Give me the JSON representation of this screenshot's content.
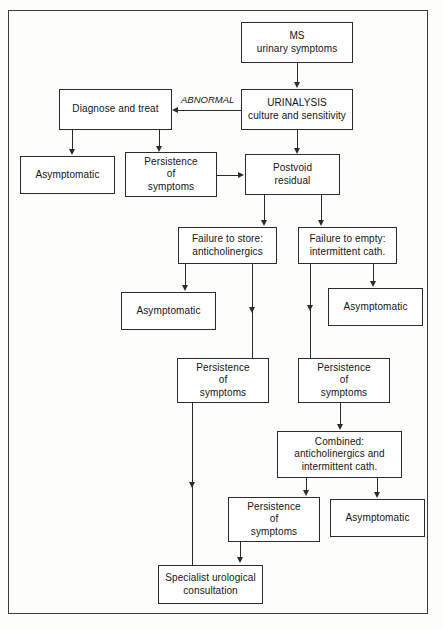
{
  "figure": {
    "kind": "clinical-algorithm-flowchart",
    "line_color": "#2b2b2b",
    "background_color": "#fdfdfb"
  },
  "nodes": {
    "ms_urinary_symptoms": "MS\nurinary symptoms",
    "urinalysis": "URINALYSIS\nculture and sensitivity",
    "diagnose_and_treat": "Diagnose and treat",
    "asymptomatic_1": "Asymptomatic",
    "persistence_1": "Persistence\nof\nsymptoms",
    "postvoid_residual": "Postvoid\nresidual",
    "failure_to_store": "Failure to store:\nanticholinergics",
    "failure_to_empty": "Failure to empty:\nintermittent cath.",
    "asymptomatic_2": "Asymptomatic",
    "asymptomatic_3": "Asymptomatic",
    "persistence_2": "Persistence\nof\nsymptoms",
    "persistence_3": "Persistence\nof\nsymptoms",
    "combined": "Combined:\nanticholinergics and\nintermittent cath.",
    "persistence_4": "Persistence\nof\nsymptoms",
    "asymptomatic_4": "Asymptomatic",
    "specialist": "Specialist  urological\nconsultation"
  },
  "edge_labels": {
    "abnormal": "ABNORMAL"
  }
}
